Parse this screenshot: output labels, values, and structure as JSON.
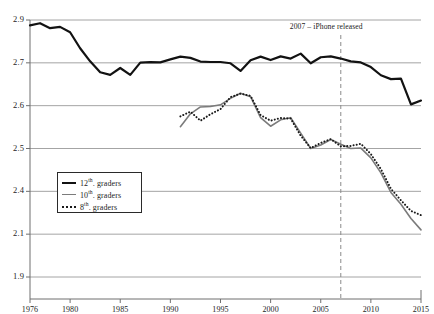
{
  "chart_data": {
    "type": "line",
    "title": "",
    "xlabel": "",
    "ylabel": "",
    "annotations": [
      {
        "text": "2007 – iPhone released",
        "x": 2007,
        "style": "dashed-vertical-line"
      }
    ],
    "legend_position": "inner-left-lower",
    "grid": true,
    "xlim": [
      1976,
      2015
    ],
    "x_ticks": [
      "1976",
      "1980",
      "1985",
      "1990",
      "1995",
      "2000",
      "2005",
      "2010",
      "2015"
    ],
    "x_tick_values": [
      1976,
      1980,
      1985,
      1990,
      1995,
      2000,
      2005,
      2010,
      2015
    ],
    "y_ticks": [
      "2.9",
      "2.7",
      "2.6",
      "2.5",
      "2.4",
      "2.1",
      "1.9"
    ],
    "y_tick_values": [
      2.9,
      2.7,
      2.6,
      2.5,
      2.4,
      2.1,
      1.9
    ],
    "ylim": [
      1.9,
      2.9
    ],
    "series": [
      {
        "name": "12th. graders",
        "style": "solid",
        "color": "#121212",
        "width": 2.2,
        "x": [
          1976,
          1977,
          1978,
          1979,
          1980,
          1981,
          1982,
          1983,
          1984,
          1985,
          1986,
          1987,
          1988,
          1989,
          1990,
          1991,
          1992,
          1993,
          1994,
          1995,
          1996,
          1997,
          1998,
          1999,
          2000,
          2001,
          2002,
          2003,
          2004,
          2005,
          2006,
          2007,
          2008,
          2009,
          2010,
          2011,
          2012,
          2013,
          2014,
          2015
        ],
        "values": [
          2.875,
          2.885,
          2.862,
          2.868,
          2.843,
          2.768,
          2.707,
          2.678,
          2.672,
          2.688,
          2.672,
          2.701,
          2.703,
          2.702,
          2.716,
          2.729,
          2.723,
          2.706,
          2.704,
          2.704,
          2.699,
          2.681,
          2.712,
          2.729,
          2.713,
          2.73,
          2.72,
          2.743,
          2.699,
          2.726,
          2.73,
          2.72,
          2.707,
          2.702,
          2.69,
          2.671,
          2.662,
          2.663,
          2.603,
          2.612
        ],
        "value_description": "12th graders series, approximate values read from chart"
      },
      {
        "name": "10th. graders",
        "style": "solid",
        "color": "#7b7b7b",
        "width": 1.6,
        "x": [
          1991,
          1992,
          1993,
          1994,
          1995,
          1996,
          1997,
          1998,
          1999,
          2000,
          2001,
          2002,
          2003,
          2004,
          2005,
          2006,
          2007,
          2008,
          2009,
          2010,
          2011,
          2012,
          2013,
          2014,
          2015
        ],
        "values": [
          2.551,
          2.581,
          2.597,
          2.598,
          2.602,
          2.617,
          2.629,
          2.621,
          2.572,
          2.552,
          2.567,
          2.572,
          2.536,
          2.5,
          2.508,
          2.521,
          2.51,
          2.5,
          2.501,
          2.478,
          2.443,
          2.392,
          2.31,
          2.21,
          2.13
        ],
        "value_description": "10th graders series, approximate values read from chart"
      },
      {
        "name": "8th. graders",
        "style": "dotted",
        "color": "#1a1a1a",
        "width": 2.0,
        "x": [
          1991,
          1992,
          1993,
          1994,
          1995,
          1996,
          1997,
          1998,
          1999,
          2000,
          2001,
          2002,
          2003,
          2004,
          2005,
          2006,
          2007,
          2008,
          2009,
          2010,
          2011,
          2012,
          2013,
          2014,
          2015
        ],
        "values": [
          2.575,
          2.586,
          2.565,
          2.58,
          2.592,
          2.62,
          2.628,
          2.623,
          2.578,
          2.565,
          2.571,
          2.57,
          2.53,
          2.501,
          2.513,
          2.522,
          2.505,
          2.506,
          2.511,
          2.487,
          2.452,
          2.406,
          2.337,
          2.263,
          2.233
        ],
        "value_description": "8th graders series, approximate values read from chart"
      }
    ]
  },
  "legend": {
    "items": [
      {
        "label_number": "12",
        "label_sup": "th",
        "label_rest": ". graders",
        "swatch": "solid-bold"
      },
      {
        "label_number": "10",
        "label_sup": "th",
        "label_rest": ". graders",
        "swatch": "solid-gray"
      },
      {
        "label_number": "8",
        "label_sup": "th",
        "label_rest": ". graders",
        "swatch": "dotted"
      }
    ]
  },
  "axes": {
    "y_labels": [
      "2.9",
      "2.7",
      "2.6",
      "2.5",
      "2.4",
      "2.1",
      "1.9"
    ],
    "x_labels": [
      "1976",
      "1980",
      "1985",
      "1990",
      "1995",
      "2000",
      "2005",
      "2010",
      "2015"
    ]
  },
  "annotation": {
    "text": "2007 – iPhone released"
  },
  "colors": {
    "grid": "#9a9a9a",
    "axis": "#6f6f6f",
    "series_12th": "#121212",
    "series_10th": "#7b7b7b",
    "series_8th": "#1a1a1a",
    "annotation_line": "#8a8a8a",
    "background": "#ffffff"
  }
}
